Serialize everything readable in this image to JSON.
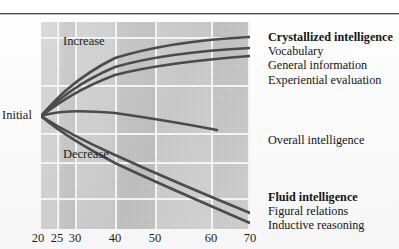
{
  "figure": {
    "axis_labels": {
      "initial": "Initial",
      "increase": "Increase",
      "decrease": "Decrease"
    },
    "legend": {
      "crystallized": {
        "heading": "Crystallized intelligence",
        "items": [
          "Vocabulary",
          "General information",
          "Experiential evaluation"
        ]
      },
      "overall": {
        "heading": "Overall intelligence",
        "items": []
      },
      "fluid": {
        "heading": "Fluid intelligence",
        "items": [
          "Figural relations",
          "Inductive reasoning"
        ]
      }
    },
    "colors": {
      "curve": "#4b4b4b",
      "plot_background": "#cfcfcf",
      "gridline": "#f3f3f3",
      "rule": "#4a4a4a",
      "text": "#1c1c1c"
    }
  },
  "chart_data": {
    "type": "line",
    "title": "",
    "xlabel": "",
    "ylabel": "",
    "xticks": [
      20,
      25,
      30,
      40,
      50,
      60,
      70
    ],
    "xtick_labels": [
      "20",
      "25",
      "30",
      "40",
      "50",
      "60",
      "70"
    ],
    "xtick_px": [
      38,
      57,
      75,
      115,
      155,
      211,
      250
    ],
    "xlim": [
      20,
      70
    ],
    "ylim": [
      -1,
      1
    ],
    "grid": true,
    "legend_position": "right",
    "annotations": [
      "Initial",
      "Increase",
      "Decrease"
    ],
    "series": [
      {
        "name": "Vocabulary",
        "group": "Crystallized intelligence",
        "x": [
          20,
          25,
          30,
          40,
          50,
          60,
          70
        ],
        "y": [
          0.0,
          0.28,
          0.44,
          0.63,
          0.74,
          0.8,
          0.84
        ]
      },
      {
        "name": "General information",
        "group": "Crystallized intelligence",
        "x": [
          20,
          25,
          30,
          40,
          50,
          60,
          70
        ],
        "y": [
          0.0,
          0.24,
          0.38,
          0.55,
          0.65,
          0.71,
          0.74
        ]
      },
      {
        "name": "Experiential evaluation",
        "group": "Crystallized intelligence",
        "x": [
          20,
          25,
          30,
          40,
          50,
          60,
          70
        ],
        "y": [
          0.0,
          0.2,
          0.32,
          0.47,
          0.56,
          0.62,
          0.66
        ]
      },
      {
        "name": "Overall intelligence",
        "group": "Overall intelligence",
        "x": [
          20,
          25,
          30,
          40,
          50,
          60,
          70
        ],
        "y": [
          0.0,
          0.04,
          0.05,
          0.02,
          -0.04,
          -0.12,
          -0.2
        ]
      },
      {
        "name": "Figural relations",
        "group": "Fluid intelligence",
        "x": [
          20,
          25,
          30,
          40,
          50,
          60,
          70
        ],
        "y": [
          0.0,
          -0.16,
          -0.27,
          -0.46,
          -0.64,
          -0.82,
          -0.98
        ]
      },
      {
        "name": "Inductive reasoning",
        "group": "Fluid intelligence",
        "x": [
          20,
          25,
          30,
          40,
          50,
          60,
          70
        ],
        "y": [
          0.0,
          -0.2,
          -0.32,
          -0.53,
          -0.72,
          -0.91,
          -1.06
        ]
      }
    ]
  }
}
